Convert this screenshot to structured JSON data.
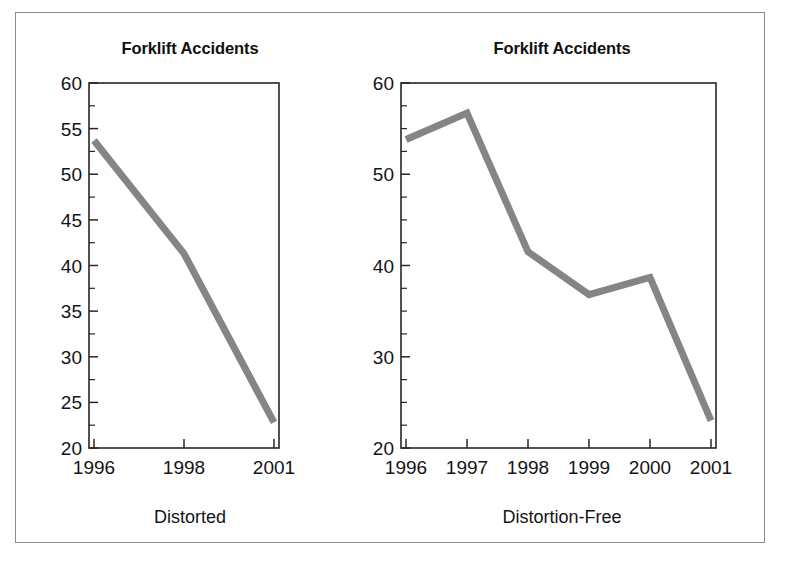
{
  "figure": {
    "border_color": "#8a8a8a",
    "background": "#ffffff",
    "line_color": "#858585"
  },
  "panels": [
    {
      "key": "distorted",
      "title": "Forklift Accidents",
      "caption": "Distorted",
      "y_labels": [
        "60",
        "55",
        "50",
        "45",
        "40",
        "35",
        "30",
        "25",
        "20"
      ],
      "x_labels": [
        "1996",
        "1998",
        "2001"
      ]
    },
    {
      "key": "distortion_free",
      "title": "Forklift Accidents",
      "caption": "Distortion-Free",
      "y_labels": [
        "60",
        "50",
        "40",
        "30",
        "20"
      ],
      "x_labels": [
        "1996",
        "1997",
        "1998",
        "1999",
        "2000",
        "2001"
      ]
    }
  ],
  "chart_data": [
    {
      "type": "line",
      "title": "Forklift Accidents",
      "subtitle": "Distorted",
      "xlabel": "",
      "ylabel": "",
      "categories": [
        "1996",
        "1998",
        "2001"
      ],
      "x": [
        1996,
        1998,
        2001
      ],
      "values": [
        53.7,
        41.3,
        22.8
      ],
      "series": [
        {
          "name": "Forklift Accidents",
          "values": [
            53.7,
            41.3,
            22.8
          ]
        }
      ],
      "ylim": [
        20,
        60
      ],
      "y_ticks": [
        20,
        25,
        30,
        35,
        40,
        45,
        50,
        55,
        60
      ],
      "y_minor_step": 2.5,
      "x_axis_type": "categorical-evenly-spaced",
      "grid": false,
      "legend": "none",
      "annotation": "X axis uses uneven year gaps (1996, 1998, 2001) drawn at equal spacing, which distorts the apparent trend."
    },
    {
      "type": "line",
      "title": "Forklift Accidents",
      "subtitle": "Distortion-Free",
      "xlabel": "",
      "ylabel": "",
      "categories": [
        "1996",
        "1997",
        "1998",
        "1999",
        "2000",
        "2001"
      ],
      "x": [
        1996,
        1997,
        1998,
        1999,
        2000,
        2001
      ],
      "values": [
        53.8,
        56.7,
        41.5,
        36.8,
        38.7,
        23.0
      ],
      "series": [
        {
          "name": "Forklift Accidents",
          "values": [
            53.8,
            56.7,
            41.5,
            36.8,
            38.7,
            23.0
          ]
        }
      ],
      "ylim": [
        20,
        60
      ],
      "y_ticks": [
        20,
        30,
        40,
        50,
        60
      ],
      "y_minor_step": 2.5,
      "x_axis_type": "linear-years",
      "grid": false,
      "legend": "none",
      "annotation": "All years shown at true spacing, revealing the real year-to-year pattern."
    }
  ]
}
